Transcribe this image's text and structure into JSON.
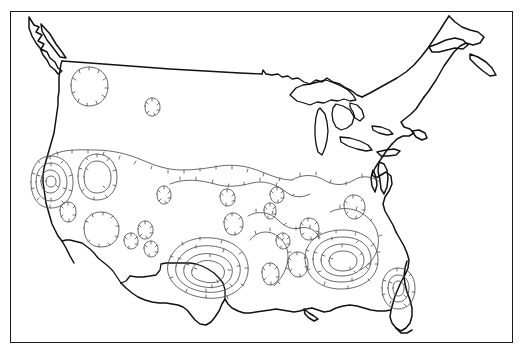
{
  "document": {
    "type": "contour-map",
    "region": "Contiguous United States",
    "background_color": "#ffffff",
    "frame": {
      "visible": true,
      "color": "#1a1a1a",
      "x": 10,
      "y": 11,
      "width": 503,
      "height": 332,
      "stroke_width": 1.4
    },
    "title": "",
    "subtitle": "",
    "caption": "",
    "labels": [],
    "legend": {
      "visible": false,
      "entries": []
    },
    "axis_labels": {
      "x": "",
      "y": ""
    }
  },
  "styles": {
    "coastline_color": "#111111",
    "coastline_width": 1.5,
    "border_color": "#111111",
    "lake_color": "#111111",
    "contour_color": "#4d4d4d",
    "contour_width": 0.85,
    "hachure_color": "#4d4d4d",
    "hachure_length": 3.2
  },
  "chart_data": {
    "type": "contour",
    "title": "",
    "xlabel": "",
    "ylabel": "",
    "projection": "conic",
    "hachured": true,
    "hachure_side": "inward",
    "centers": [
      {
        "name": "pacific-northwest-montana",
        "approx_x": 90,
        "approx_y": 85,
        "rings": 1
      },
      {
        "name": "central-plains-minor",
        "approx_x": 152,
        "approx_y": 110,
        "rings": 1
      },
      {
        "name": "california-nevada",
        "approx_x": 48,
        "approx_y": 182,
        "rings": 3
      },
      {
        "name": "great-basin",
        "approx_x": 95,
        "approx_y": 200,
        "rings": 2
      },
      {
        "name": "arizona-new-mexico",
        "approx_x": 100,
        "approx_y": 232,
        "rings": 1
      },
      {
        "name": "texas-gulf",
        "approx_x": 205,
        "approx_y": 272,
        "rings": 4
      },
      {
        "name": "southeast-gulf",
        "approx_x": 340,
        "approx_y": 262,
        "rings": 4
      },
      {
        "name": "florida-peninsula",
        "approx_x": 397,
        "approx_y": 288,
        "rings": 2
      },
      {
        "name": "ohio-valley-minor",
        "approx_x": 276,
        "approx_y": 196,
        "rings": 1
      },
      {
        "name": "mid-south-minor",
        "approx_x": 308,
        "approx_y": 232,
        "rings": 1
      }
    ],
    "contour_levels": [
      1,
      2,
      3,
      4,
      5
    ],
    "grid": false,
    "legend_position": "none"
  },
  "features": {
    "coastlines": [
      "pacific-coast",
      "gulf-coast",
      "atlantic-coast",
      "great-lakes",
      "st-lawrence"
    ],
    "borders": [
      "canada-49th-parallel",
      "mexico-border"
    ],
    "named_waterbodies": [
      "Lake Superior",
      "Lake Michigan",
      "Lake Huron",
      "Lake Erie",
      "Lake Ontario"
    ]
  }
}
